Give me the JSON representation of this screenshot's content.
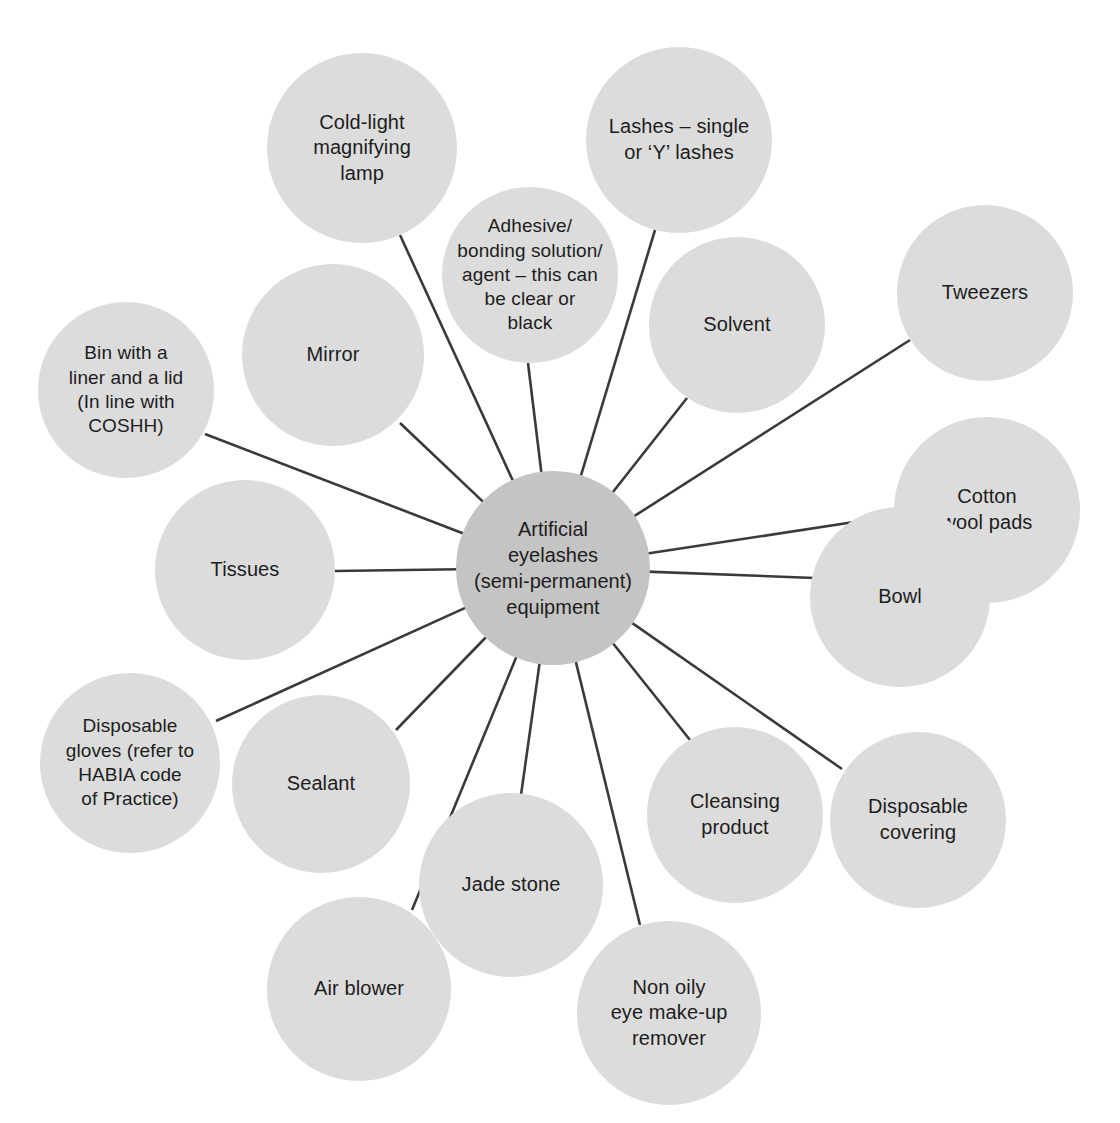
{
  "diagram": {
    "type": "mind-map",
    "title": "Artificial eyelashes (semi-permanent) equipment",
    "background_color": "#ffffff",
    "node_color": "#dcdcdc",
    "center_node_color": "#c4c4c4",
    "edge_color": "#3a3a3a",
    "text_color": "#1d1d1d",
    "center": {
      "label": "Artificial\neyelashes\n(semi-permanent)\nequipment",
      "cx": 553,
      "cy": 568,
      "r": 97
    },
    "nodes": [
      {
        "id": "cold-light-magnifying-lamp",
        "label": "Cold-light\nmagnifying\nlamp",
        "cx": 362,
        "cy": 148,
        "r": 95,
        "edge_anchor": {
          "x": 400,
          "y": 235
        }
      },
      {
        "id": "adhesive-bonding-solution",
        "label": "Adhesive/\nbonding solution/\nagent – this can\nbe clear or\nblack",
        "cx": 530,
        "cy": 275,
        "r": 88,
        "edge_anchor": {
          "x": 528,
          "y": 363
        }
      },
      {
        "id": "lashes-single-or-y",
        "label": "Lashes – single\nor ‘Y’ lashes",
        "cx": 679,
        "cy": 140,
        "r": 93,
        "edge_anchor": {
          "x": 655,
          "y": 230
        }
      },
      {
        "id": "solvent",
        "label": "Solvent",
        "cx": 737,
        "cy": 325,
        "r": 88,
        "edge_anchor": {
          "x": 687,
          "y": 398
        }
      },
      {
        "id": "tweezers",
        "label": "Tweezers",
        "cx": 985,
        "cy": 293,
        "r": 88,
        "edge_anchor": {
          "x": 910,
          "y": 340
        }
      },
      {
        "id": "cotton-wool-pads",
        "label": "Cotton\nwool pads",
        "cx": 987,
        "cy": 510,
        "r": 93,
        "edge_anchor": {
          "x": 900,
          "y": 515
        }
      },
      {
        "id": "bowl",
        "label": "Bowl",
        "cx": 900,
        "cy": 597,
        "r": 90,
        "edge_anchor": {
          "x": 815,
          "y": 578
        }
      },
      {
        "id": "disposable-covering",
        "label": "Disposable\ncovering",
        "cx": 918,
        "cy": 820,
        "r": 88,
        "edge_anchor": {
          "x": 842,
          "y": 769
        }
      },
      {
        "id": "cleansing-product",
        "label": "Cleansing\nproduct",
        "cx": 735,
        "cy": 815,
        "r": 88,
        "edge_anchor": {
          "x": 690,
          "y": 740
        }
      },
      {
        "id": "non-oily-eye-make-up-remover",
        "label": "Non oily\neye make-up\nremover",
        "cx": 669,
        "cy": 1013,
        "r": 92,
        "edge_anchor": {
          "x": 640,
          "y": 925
        }
      },
      {
        "id": "jade-stone",
        "label": "Jade stone",
        "cx": 511,
        "cy": 885,
        "r": 92,
        "edge_anchor": {
          "x": 521,
          "y": 795
        }
      },
      {
        "id": "air-blower",
        "label": "Air blower",
        "cx": 359,
        "cy": 989,
        "r": 92,
        "edge_anchor": {
          "x": 412,
          "y": 910
        }
      },
      {
        "id": "sealant",
        "label": "Sealant",
        "cx": 321,
        "cy": 784,
        "r": 89,
        "edge_anchor": {
          "x": 396,
          "y": 730
        }
      },
      {
        "id": "disposable-gloves-habia",
        "label": "Disposable\ngloves (refer to\nHABIA code\nof Practice)",
        "cx": 130,
        "cy": 763,
        "r": 90,
        "edge_anchor": {
          "x": 216,
          "y": 721
        }
      },
      {
        "id": "tissues",
        "label": "Tissues",
        "cx": 245,
        "cy": 570,
        "r": 90,
        "edge_anchor": {
          "x": 335,
          "y": 571
        }
      },
      {
        "id": "bin-with-liner-and-lid",
        "label": "Bin with a\nliner and a lid\n(In line with\nCOSHH)",
        "cx": 126,
        "cy": 390,
        "r": 88,
        "edge_anchor": {
          "x": 205,
          "y": 434
        }
      },
      {
        "id": "mirror",
        "label": "Mirror",
        "cx": 333,
        "cy": 355,
        "r": 91,
        "edge_anchor": {
          "x": 400,
          "y": 423
        }
      }
    ]
  }
}
